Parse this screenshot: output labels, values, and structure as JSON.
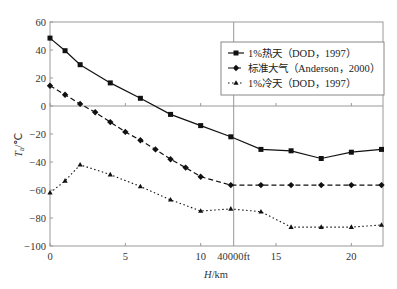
{
  "chart_data": {
    "type": "line",
    "title": "",
    "xlabel": "H/km",
    "ylabel": "Ta/℃",
    "xlim": [
      0,
      22.1
    ],
    "ylim": [
      -100,
      60
    ],
    "x_ticks": [
      0,
      5,
      10,
      15,
      20
    ],
    "x_tick_labels": [
      "0",
      "5",
      "10",
      "15",
      "20"
    ],
    "y_ticks": [
      60,
      40,
      20,
      0,
      -20,
      -40,
      -60,
      -80,
      -100
    ],
    "y_tick_labels": [
      "60",
      "40",
      "20",
      "0",
      "−20",
      "−40",
      "−60",
      "−80",
      "−100"
    ],
    "reference_line": {
      "x": 12.19,
      "label": "40000ft"
    },
    "grid": false,
    "legend_position": "upper right",
    "series": [
      {
        "name": "1%热天（DOD，1997）",
        "style": "solid",
        "marker": "square",
        "x": [
          0,
          1,
          2,
          4,
          6,
          8,
          10,
          12,
          14,
          16,
          18,
          20,
          22
        ],
        "values": [
          48.5,
          39.5,
          29.5,
          16.5,
          5.5,
          -6,
          -14,
          -22,
          -31,
          -32,
          -37.5,
          -33,
          -31
        ]
      },
      {
        "name": "标准大气（Anderson，2000）",
        "style": "dashed",
        "marker": "diamond",
        "x": [
          0,
          1,
          2,
          3,
          4,
          5,
          6,
          7,
          8,
          9,
          10,
          12,
          14,
          16,
          18,
          20,
          22
        ],
        "values": [
          14.5,
          8,
          1.5,
          -4.5,
          -11.5,
          -18.5,
          -24.5,
          -31,
          -38,
          -44,
          -50.5,
          -56.5,
          -56.5,
          -56.5,
          -56.5,
          -56.5,
          -56.5
        ]
      },
      {
        "name": "1%冷天（DOD，1997）",
        "style": "dotted",
        "marker": "triangle",
        "x": [
          0,
          1,
          2,
          4,
          6,
          8,
          10,
          12,
          14,
          16,
          18,
          20,
          22
        ],
        "values": [
          -62,
          -53.5,
          -42,
          -49,
          -57.5,
          -67,
          -75,
          -73.5,
          -75.5,
          -86.5,
          -86.5,
          -86.5,
          -85
        ]
      }
    ]
  }
}
